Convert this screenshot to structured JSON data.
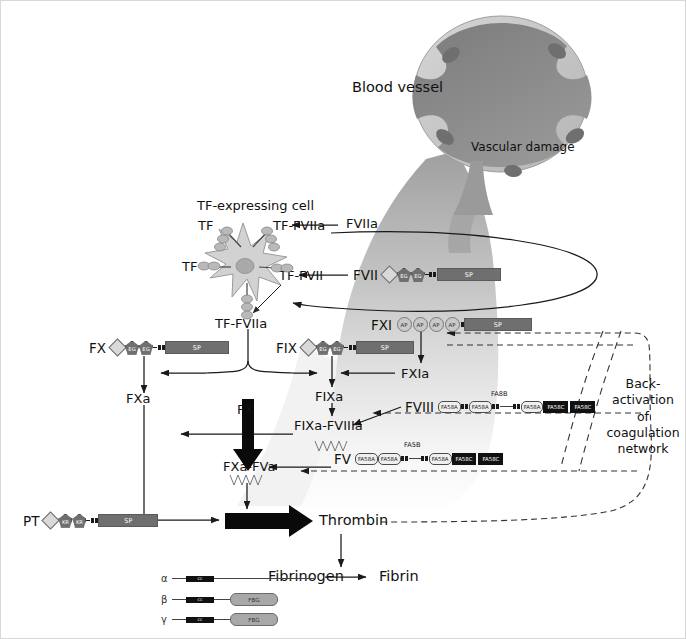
{
  "vessel": {
    "label": "Blood vessel",
    "damage_label": "Vascular damage",
    "lumen_color": "#8a8a8a",
    "wall_color": "#c9c9c9",
    "nucleus_color": "#6b6b6b"
  },
  "cell": {
    "label": "TF-expressing cell",
    "body_color": "#d2d2d2",
    "nucleus_color": "#a9a9a9",
    "receptors": [
      {
        "name": "TF",
        "position": "upper-left"
      },
      {
        "name": "TF-FVIIa",
        "position": "upper-right"
      },
      {
        "name": "TF",
        "position": "left"
      },
      {
        "name": "TF-FVII",
        "position": "right"
      }
    ]
  },
  "nodes": {
    "tf_upper_left": "TF",
    "tf_fviia_cell": "TF-FVIIa",
    "tf_left": "TF",
    "tf_fvii_cell": "TF-FVII",
    "tf_fviia_main": "TF-FVIIa",
    "fviia": "FVIIa",
    "fxa": "FXa",
    "fixa": "FIXa",
    "fxia": "FXIa",
    "fixa_fviiia": "FIXa-FVIIIa",
    "fxa_fva": "FXa-FVa",
    "fx_thick": "FX",
    "thrombin": "Thrombin",
    "fibrinogen": "Fibrinogen",
    "fibrin": "Fibrin",
    "back_activation": [
      "Back-",
      "activation",
      "of",
      "coagulation",
      "network"
    ]
  },
  "proteins": [
    {
      "id": "fvii",
      "name": "FVII",
      "domains": [
        "Gla",
        "EG",
        "EG",
        "link",
        "link",
        "SP"
      ],
      "sp_label": "SP"
    },
    {
      "id": "fx",
      "name": "FX",
      "domains": [
        "Gla",
        "EG",
        "EG",
        "link",
        "link",
        "SP"
      ],
      "sp_label": "SP"
    },
    {
      "id": "fix",
      "name": "FIX",
      "domains": [
        "Gla",
        "EG",
        "EG",
        "link",
        "link",
        "SP"
      ],
      "sp_label": "SP"
    },
    {
      "id": "fxi",
      "name": "FXI",
      "domains": [
        "AP",
        "AP",
        "AP",
        "AP",
        "link",
        "SP"
      ],
      "sp_label": "SP"
    },
    {
      "id": "pt",
      "name": "PT",
      "domains": [
        "Gla",
        "KR",
        "KR",
        "link",
        "link",
        "SP"
      ],
      "sp_label": "SP"
    },
    {
      "id": "fviii",
      "name": "FVIII",
      "connector_label": "FA8B",
      "domains": [
        "FA58A",
        "FA58A",
        "FA58A",
        "FA58C",
        "FA58C"
      ]
    },
    {
      "id": "fv",
      "name": "FV",
      "connector_label": "FA5B",
      "domains": [
        "FA58A",
        "FA58A",
        "FA58A",
        "FA58C",
        "FA58C"
      ]
    }
  ],
  "domain_labels": {
    "gla": "",
    "egf": "EG",
    "kringle": "KR",
    "apple": "AP",
    "sp": "SP",
    "fa58a": "FA58A",
    "fa58c": "FA58C",
    "fbg": "FBG",
    "coiled_coil": "cc"
  },
  "fibrinogen_chains": [
    {
      "chain": "α",
      "cc_label": "cc",
      "has_fbg": false,
      "fbg_label": "FBG"
    },
    {
      "chain": "β",
      "cc_label": "cc",
      "has_fbg": true,
      "fbg_label": "FBG"
    },
    {
      "chain": "γ",
      "cc_label": "cc",
      "has_fbg": true,
      "fbg_label": "FBG"
    }
  ],
  "colors": {
    "line": "#1a1a1a",
    "dashed": "#333333",
    "wash_dark": "#9a9a9a",
    "wash_light": "#e8e8e8",
    "text": "#111111",
    "border": "#d8d8d8"
  }
}
